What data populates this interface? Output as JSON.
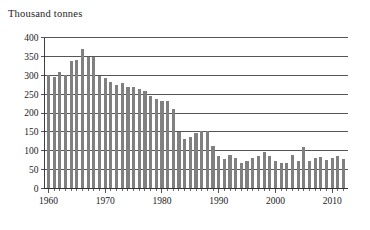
{
  "chart_data": {
    "type": "bar",
    "title": "Thousand tonnes",
    "xlabel": "",
    "ylabel": "",
    "ylim": [
      0,
      400
    ],
    "ytick_step": 50,
    "yticks": [
      0,
      50,
      100,
      150,
      200,
      250,
      300,
      350,
      400
    ],
    "ytick_labels": [
      "0",
      "50",
      "100",
      "150",
      "200",
      "250",
      "300",
      "350",
      "400"
    ],
    "xticks": [
      1960,
      1970,
      1980,
      1990,
      2000,
      2010
    ],
    "xtick_labels": [
      "1960",
      "1970",
      "1980",
      "1990",
      "2000",
      "2010"
    ],
    "xlim": [
      1959.3,
      2012.7
    ],
    "grid": "horizontal",
    "legend": "none",
    "bar_color": "#808080",
    "axis_color": "#2b2b2b",
    "categories": [
      1960,
      1961,
      1962,
      1963,
      1964,
      1965,
      1966,
      1967,
      1968,
      1969,
      1970,
      1971,
      1972,
      1973,
      1974,
      1975,
      1976,
      1977,
      1978,
      1979,
      1980,
      1981,
      1982,
      1983,
      1984,
      1985,
      1986,
      1987,
      1988,
      1989,
      1990,
      1991,
      1992,
      1993,
      1994,
      1995,
      1996,
      1997,
      1998,
      1999,
      2000,
      2001,
      2002,
      2003,
      2004,
      2005,
      2006,
      2007,
      2008,
      2009,
      2010,
      2011,
      2012
    ],
    "values": [
      300,
      296,
      308,
      302,
      338,
      341,
      370,
      348,
      348,
      299,
      293,
      281,
      273,
      280,
      268,
      270,
      263,
      259,
      244,
      237,
      233,
      233,
      210,
      150,
      131,
      136,
      148,
      152,
      152,
      113,
      86,
      79,
      88,
      82,
      68,
      72,
      81,
      87,
      97,
      86,
      73,
      67,
      68,
      88,
      73,
      110,
      74,
      80,
      83,
      75,
      81,
      86,
      78
    ]
  }
}
